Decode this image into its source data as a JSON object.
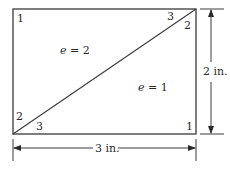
{
  "diagram": {
    "type": "triangular-element-mesh",
    "colors": {
      "line": "#3a3a3a",
      "text": "#2a2a2a",
      "background": "#ffffff"
    },
    "elements": [
      {
        "id": "e2",
        "label": "e = 2",
        "var": "e",
        "value": "2"
      },
      {
        "id": "e1",
        "label": "e = 1",
        "var": "e",
        "value": "1"
      }
    ],
    "node_labels": {
      "top_left": "1",
      "top_right_elem2": "3",
      "top_right_elem1": "2",
      "bottom_left_elem2": "2",
      "bottom_left_elem1": "3",
      "bottom_right": "1"
    },
    "dimensions": {
      "height": "2 in.",
      "width": "3 in."
    }
  }
}
